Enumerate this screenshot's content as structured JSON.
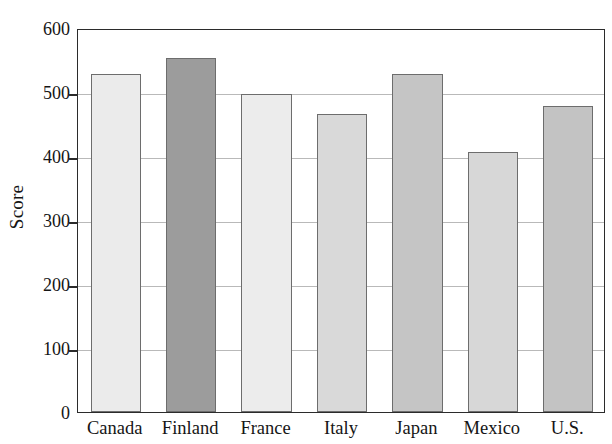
{
  "chart_data": {
    "type": "bar",
    "title": "",
    "subtitle": "",
    "xlabel": "",
    "ylabel": "Score",
    "categories": [
      "Canada",
      "Finland",
      "France",
      "Italy",
      "Japan",
      "Mexico",
      "U.S."
    ],
    "values": [
      528,
      553,
      497,
      466,
      528,
      407,
      478
    ],
    "series": [
      {
        "name": "Score",
        "values": [
          528,
          553,
          497,
          466,
          528,
          407,
          478
        ]
      }
    ],
    "bar_colors": [
      "#ebebeb",
      "#9c9c9c",
      "#ececec",
      "#d9d9d9",
      "#c5c5c5",
      "#d7d7d7",
      "#c3c3c3"
    ],
    "bar_edge_color": "#6d6d6d",
    "ylim": [
      0,
      600
    ],
    "ytick_values": [
      0,
      100,
      200,
      300,
      400,
      500,
      600
    ],
    "ytick_labels": [
      "0",
      "100",
      "200",
      "300",
      "400",
      "500",
      "600"
    ],
    "grid": true,
    "grid_color": "#b9b9b9",
    "legend": null,
    "legend_position": "none",
    "annotations": [],
    "axis_color": "#2b2b2b",
    "background_color": "#ffffff"
  }
}
